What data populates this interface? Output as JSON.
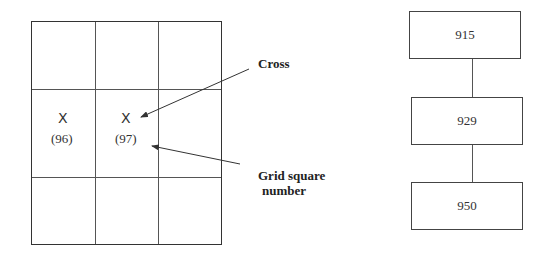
{
  "grid": {
    "rows": 3,
    "cols": 3,
    "cells": [
      {
        "row": 1,
        "col": 0,
        "mark": "X",
        "number": "(96)"
      },
      {
        "row": 1,
        "col": 1,
        "mark": "X",
        "number": "(97)"
      }
    ]
  },
  "annotations": {
    "cross_label": "Cross",
    "grid_square_label_line1": "Grid square",
    "grid_square_label_line2": "number"
  },
  "flow": {
    "boxes": [
      {
        "label": "915"
      },
      {
        "label": "929"
      },
      {
        "label": "950"
      }
    ]
  },
  "colors": {
    "line": "#333333",
    "text": "#222222",
    "background": "#ffffff"
  }
}
